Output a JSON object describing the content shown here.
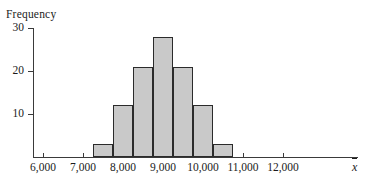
{
  "chart_data": {
    "type": "bar",
    "title": "",
    "xlabel": "x̄",
    "ylabel": "Frequency",
    "categories": [
      "7,250–7,750",
      "7,750–8,250",
      "8,250–8,750",
      "8,750–9,250",
      "9,250–9,750",
      "9,750–10,250",
      "10,250–10,750"
    ],
    "bin_edges": [
      7250,
      7750,
      8250,
      8750,
      9250,
      9750,
      10250,
      10750
    ],
    "values": [
      3,
      12,
      21,
      28,
      21,
      12,
      3
    ],
    "bin_width": 500,
    "xlim": [
      5750,
      12500
    ],
    "ylim": [
      0,
      30
    ],
    "grid": false,
    "legend": null,
    "bar_fill_color": "#c9c9c9",
    "bar_edge_color": "#2b2b2b",
    "axis_color": "#3a3a3a"
  },
  "axes": {
    "y_title": "Frequency",
    "y_ticks": [
      {
        "label": "30",
        "value": 30
      },
      {
        "label": "20",
        "value": 20
      },
      {
        "label": "10",
        "value": 10
      }
    ],
    "x_ticks": [
      {
        "label": "6,000",
        "value": 6000
      },
      {
        "label": "7,000",
        "value": 7000
      },
      {
        "label": "8,000",
        "value": 8000
      },
      {
        "label": "9,000",
        "value": 9000
      },
      {
        "label": "10,000",
        "value": 10000
      },
      {
        "label": "11,000",
        "value": 11000
      },
      {
        "label": "12,000",
        "value": 12000
      }
    ],
    "x_variable_symbol": "x"
  }
}
